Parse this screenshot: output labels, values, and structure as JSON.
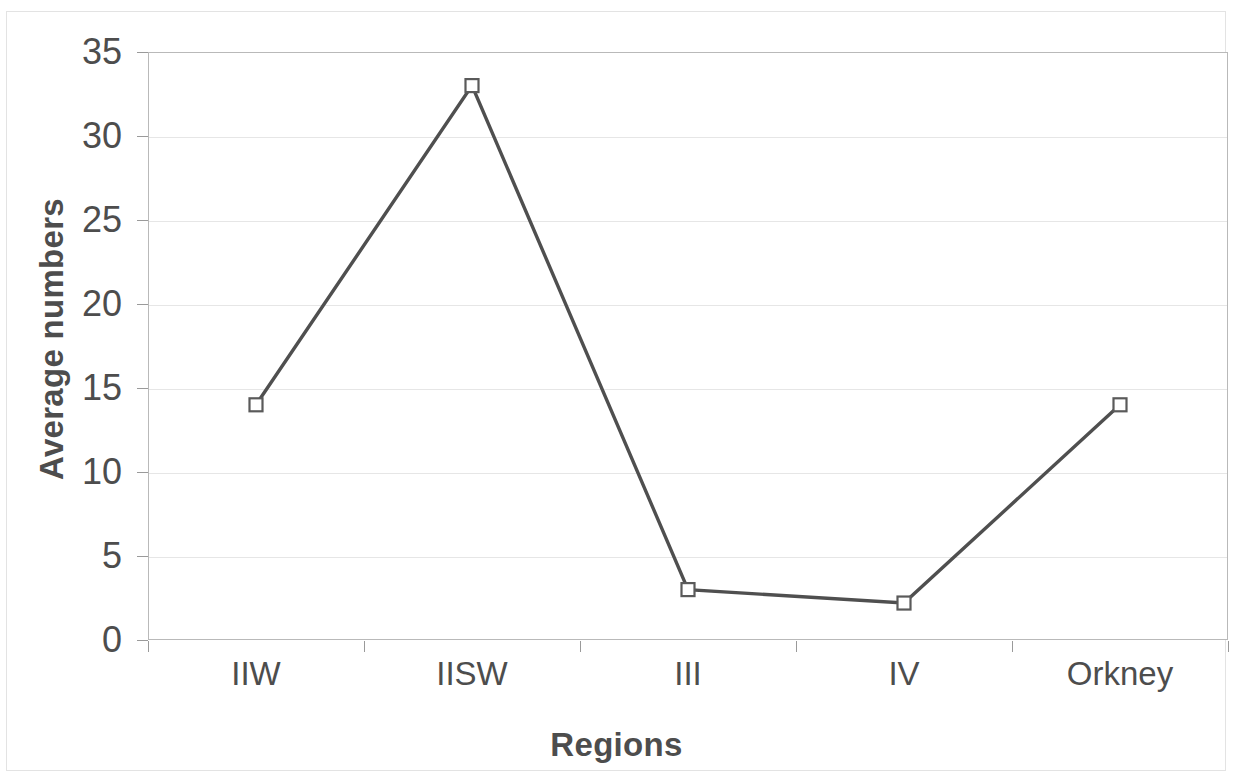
{
  "chart_data": {
    "type": "line",
    "title": "",
    "subtitle": "",
    "xlabel": "Regions",
    "ylabel": "Average numbers",
    "categories": [
      "IIW",
      "IISW",
      "III",
      "IV",
      "Orkney"
    ],
    "values": [
      14,
      33,
      3,
      2.2,
      14
    ],
    "series": [
      {
        "name": "Average numbers",
        "values": [
          14,
          33,
          3,
          2.2,
          14
        ]
      }
    ],
    "ylim": [
      0,
      35
    ],
    "ytick_values": [
      0,
      5,
      10,
      15,
      20,
      25,
      30,
      35
    ],
    "ytick_labels": [
      "0",
      "5",
      "10",
      "15",
      "20",
      "25",
      "30",
      "35"
    ],
    "xtick_labels": [
      "IIW",
      "IISW",
      "III",
      "IV",
      "Orkney"
    ],
    "grid": "horizontal",
    "legend": "none",
    "marker": "open-square",
    "line_color": "#4f4f4f",
    "marker_fill": "#ffffff",
    "marker_stroke": "#5a5a5a",
    "gridline_color": "#e6e6e6",
    "axis_color": "#9a9a9a",
    "text_color": "#4d4d4d",
    "background": "#ffffff",
    "annotations": []
  }
}
